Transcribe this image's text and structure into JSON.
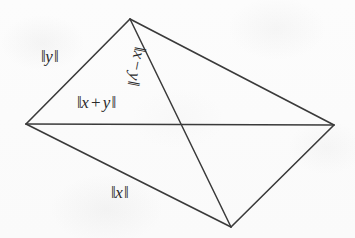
{
  "figure": {
    "background_color": "#fdfdfd",
    "stroke_color": "#3a3a3a",
    "text_color": "#2b2b2b"
  },
  "vertices": {
    "left": {
      "name": "left-vertex",
      "x": 26,
      "y": 124
    },
    "top": {
      "name": "top-vertex",
      "x": 130,
      "y": 19
    },
    "right": {
      "name": "right-vertex",
      "x": 334,
      "y": 125
    },
    "bottom": {
      "name": "bottom-vertex",
      "x": 231,
      "y": 227
    }
  },
  "edges": [
    {
      "name": "side-left-top",
      "from": "left",
      "to": "top",
      "label": "norm_y"
    },
    {
      "name": "side-top-right",
      "from": "top",
      "to": "right",
      "label": null
    },
    {
      "name": "side-left-bottom",
      "from": "left",
      "to": "bottom",
      "label": "norm_x"
    },
    {
      "name": "side-bottom-right",
      "from": "bottom",
      "to": "right",
      "label": null
    },
    {
      "name": "diagonal-horizontal",
      "from": "left",
      "to": "right",
      "label": "norm_x_plus_y"
    },
    {
      "name": "diagonal-slanted",
      "from": "top",
      "to": "bottom",
      "label": "norm_x_minus_y"
    }
  ],
  "labels": {
    "norm_y": {
      "open_bars": "‖",
      "variable": "y",
      "close_bars": "‖",
      "full_text": "‖y‖",
      "rotation_deg": 0
    },
    "norm_x": {
      "open_bars": "‖",
      "variable": "x",
      "close_bars": "‖",
      "full_text": "‖x‖",
      "rotation_deg": 0
    },
    "norm_x_plus_y": {
      "open_bars": "‖",
      "variable_1": "x",
      "operator": "+",
      "variable_2": "y",
      "close_bars": "‖",
      "full_text": "‖x + y‖",
      "rotation_deg": 0
    },
    "norm_x_minus_y": {
      "open_bars": "‖",
      "variable_1": "x",
      "operator": "−",
      "variable_2": "y",
      "close_bars": "‖",
      "full_text": "‖x − y‖",
      "rotation_deg": 101
    }
  }
}
